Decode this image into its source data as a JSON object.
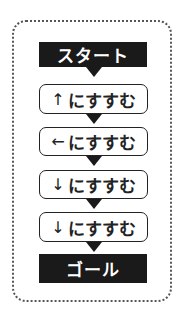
{
  "flowchart": {
    "start_label": "スタート",
    "end_label": "ゴール",
    "steps": [
      {
        "arrow": "↑",
        "text": "にすすむ"
      },
      {
        "arrow": "←",
        "text": "にすすむ"
      },
      {
        "arrow": "↓",
        "text": "にすすむ"
      },
      {
        "arrow": "↓",
        "text": "にすすむ"
      }
    ]
  },
  "colors": {
    "terminal_bg": "#1a1a1a",
    "terminal_text": "#ffffff",
    "border": "#222222"
  }
}
